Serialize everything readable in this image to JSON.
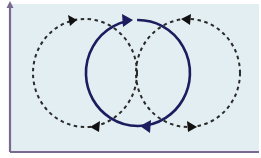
{
  "diagram": {
    "colors": {
      "background": "#e3eef2",
      "axis": "#7a6a92",
      "solid_cycle": "#1c1c5e",
      "dashed_cycle": "#2a2a2a"
    },
    "frame": {
      "x_axis": "horizontal baseline",
      "y_axis": "vertical arrow pointing up"
    },
    "cycles": [
      {
        "name": "left-cycle",
        "style": "dashed",
        "direction": "clockwise"
      },
      {
        "name": "center-cycle",
        "style": "solid",
        "direction": "clockwise"
      },
      {
        "name": "right-cycle",
        "style": "dashed",
        "direction": "counterclockwise"
      }
    ]
  }
}
